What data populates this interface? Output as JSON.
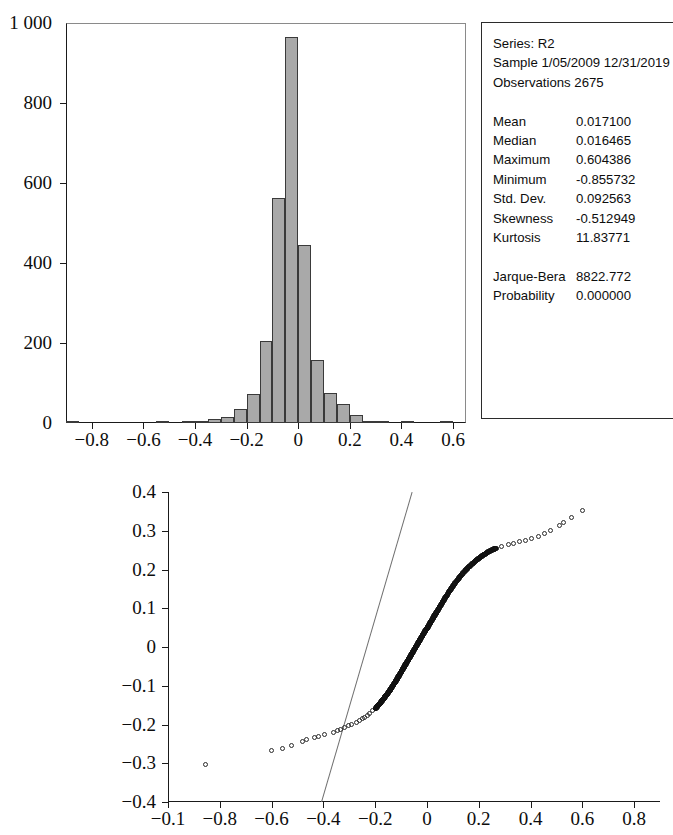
{
  "stats_box": {
    "header_lines": [
      "Series: R2",
      "Sample 1/05/2009 12/31/2019",
      "Observations 2675"
    ],
    "rows": [
      {
        "label": "Mean",
        "value": "0.017100"
      },
      {
        "label": "Median",
        "value": "0.016465"
      },
      {
        "label": "Maximum",
        "value": "0.604386"
      },
      {
        "label": "Minimum",
        "value": "-0.855732"
      },
      {
        "label": "Std. Dev.",
        "value": "0.092563"
      },
      {
        "label": "Skewness",
        "value": "-0.512949"
      },
      {
        "label": "Kurtosis",
        "value": "11.83771"
      }
    ],
    "test_rows": [
      {
        "label": "Jarque-Bera",
        "value": "8822.772"
      },
      {
        "label": "Probability",
        "value": "0.000000"
      }
    ]
  },
  "chart_data": [
    {
      "type": "bar",
      "name": "histogram",
      "title": "",
      "xlabel": "",
      "ylabel": "",
      "series_name": "R2",
      "observations": 2675,
      "bin_width": 0.05,
      "xlim": [
        -0.9,
        0.65
      ],
      "ylim": [
        0,
        1000
      ],
      "xticks": [
        -0.8,
        -0.6,
        -0.4,
        -0.2,
        0,
        0.2,
        0.4,
        0.6
      ],
      "xticklabels": [
        "−0.8",
        "−0.6",
        "−0.4",
        "−0.2",
        "0",
        "0.2",
        "0.4",
        "0.6"
      ],
      "yticks": [
        0,
        200,
        400,
        600,
        800,
        1000
      ],
      "yticklabels": [
        "0",
        "200",
        "400",
        "600",
        "800",
        "1 000"
      ],
      "grid": false,
      "bar_color": "#a9a9a9",
      "bar_edge_color": "#3a3a3a",
      "bins": [
        {
          "center": -0.875,
          "count": 3
        },
        {
          "center": -0.825,
          "count": 0
        },
        {
          "center": -0.775,
          "count": 0
        },
        {
          "center": -0.725,
          "count": 0
        },
        {
          "center": -0.675,
          "count": 0
        },
        {
          "center": -0.625,
          "count": 0
        },
        {
          "center": -0.575,
          "count": 0
        },
        {
          "center": -0.525,
          "count": 2
        },
        {
          "center": -0.475,
          "count": 0
        },
        {
          "center": -0.425,
          "count": 3
        },
        {
          "center": -0.375,
          "count": 4
        },
        {
          "center": -0.325,
          "count": 9
        },
        {
          "center": -0.275,
          "count": 16
        },
        {
          "center": -0.225,
          "count": 34
        },
        {
          "center": -0.175,
          "count": 72
        },
        {
          "center": -0.125,
          "count": 205
        },
        {
          "center": -0.075,
          "count": 562
        },
        {
          "center": -0.025,
          "count": 965
        },
        {
          "center": 0.025,
          "count": 444
        },
        {
          "center": 0.075,
          "count": 158
        },
        {
          "center": 0.125,
          "count": 74
        },
        {
          "center": 0.175,
          "count": 48
        },
        {
          "center": 0.225,
          "count": 20
        },
        {
          "center": 0.275,
          "count": 6
        },
        {
          "center": 0.325,
          "count": 3
        },
        {
          "center": 0.375,
          "count": 0
        },
        {
          "center": 0.425,
          "count": 2
        },
        {
          "center": 0.475,
          "count": 0
        },
        {
          "center": 0.525,
          "count": 0
        },
        {
          "center": 0.575,
          "count": 3
        }
      ]
    },
    {
      "type": "scatter",
      "name": "qq-plot",
      "title": "",
      "xlabel": "",
      "ylabel": "",
      "xlim": [
        -1.0,
        0.9
      ],
      "ylim": [
        -0.4,
        0.4
      ],
      "xticks": [
        -1.0,
        -0.8,
        -0.6,
        -0.4,
        -0.2,
        0,
        0.2,
        0.4,
        0.6,
        0.8
      ],
      "xticklabels": [
        "−0.1",
        "−0.8",
        "−0.6",
        "−0.4",
        "−0.2",
        "0",
        "0.2",
        "0.4",
        "0.6",
        "0.8"
      ],
      "yticks": [
        -0.4,
        -0.3,
        -0.2,
        -0.1,
        0,
        0.1,
        0.2,
        0.3,
        0.4
      ],
      "yticklabels": [
        "−0.4",
        "−0.3",
        "−0.2",
        "−0.1",
        "0",
        "0.1",
        "0.2",
        "0.3",
        "0.4"
      ],
      "grid": false,
      "marker": "open-circle",
      "marker_color": "#2a2a2a",
      "refline_color": "#6f6f6f",
      "refline": {
        "x0": -0.41,
        "y0": -0.4,
        "x1": -0.06,
        "y1": 0.4
      },
      "points": [
        {
          "x": -0.855,
          "y": -0.305
        },
        {
          "x": -0.6,
          "y": -0.268
        },
        {
          "x": -0.555,
          "y": -0.262
        },
        {
          "x": -0.52,
          "y": -0.255
        },
        {
          "x": -0.478,
          "y": -0.245
        },
        {
          "x": -0.462,
          "y": -0.241
        },
        {
          "x": -0.432,
          "y": -0.236
        },
        {
          "x": -0.418,
          "y": -0.233
        },
        {
          "x": -0.392,
          "y": -0.228
        },
        {
          "x": -0.36,
          "y": -0.221
        },
        {
          "x": -0.345,
          "y": -0.218
        },
        {
          "x": -0.33,
          "y": -0.213
        },
        {
          "x": -0.318,
          "y": -0.21
        },
        {
          "x": -0.3,
          "y": -0.205
        },
        {
          "x": -0.288,
          "y": -0.201
        },
        {
          "x": -0.272,
          "y": -0.196
        },
        {
          "x": -0.26,
          "y": -0.192
        },
        {
          "x": -0.248,
          "y": -0.187
        },
        {
          "x": -0.238,
          "y": -0.182
        },
        {
          "x": -0.228,
          "y": -0.177
        },
        {
          "x": -0.218,
          "y": -0.172
        },
        {
          "x": -0.208,
          "y": -0.166
        },
        {
          "x": -0.198,
          "y": -0.16
        },
        {
          "x": -0.19,
          "y": -0.154
        },
        {
          "x": -0.182,
          "y": -0.148
        },
        {
          "x": -0.174,
          "y": -0.141
        },
        {
          "x": -0.166,
          "y": -0.134
        },
        {
          "x": -0.158,
          "y": -0.127
        },
        {
          "x": -0.15,
          "y": -0.12
        },
        {
          "x": -0.142,
          "y": -0.113
        },
        {
          "x": -0.135,
          "y": -0.105
        },
        {
          "x": -0.128,
          "y": -0.098
        },
        {
          "x": -0.12,
          "y": -0.09
        },
        {
          "x": -0.113,
          "y": -0.082
        },
        {
          "x": -0.106,
          "y": -0.074
        },
        {
          "x": -0.099,
          "y": -0.066
        },
        {
          "x": -0.092,
          "y": -0.058
        },
        {
          "x": -0.085,
          "y": -0.05
        },
        {
          "x": -0.078,
          "y": -0.042
        },
        {
          "x": -0.071,
          "y": -0.034
        },
        {
          "x": -0.064,
          "y": -0.026
        },
        {
          "x": -0.057,
          "y": -0.018
        },
        {
          "x": -0.05,
          "y": -0.01
        },
        {
          "x": -0.043,
          "y": -0.002
        },
        {
          "x": -0.036,
          "y": 0.006
        },
        {
          "x": -0.029,
          "y": 0.014
        },
        {
          "x": -0.022,
          "y": 0.022
        },
        {
          "x": -0.015,
          "y": 0.03
        },
        {
          "x": -0.008,
          "y": 0.038
        },
        {
          "x": 0.0,
          "y": 0.046
        },
        {
          "x": 0.008,
          "y": 0.055
        },
        {
          "x": 0.016,
          "y": 0.064
        },
        {
          "x": 0.024,
          "y": 0.073
        },
        {
          "x": 0.033,
          "y": 0.083
        },
        {
          "x": 0.042,
          "y": 0.093
        },
        {
          "x": 0.052,
          "y": 0.104
        },
        {
          "x": 0.062,
          "y": 0.115
        },
        {
          "x": 0.073,
          "y": 0.127
        },
        {
          "x": 0.085,
          "y": 0.14
        },
        {
          "x": 0.098,
          "y": 0.153
        },
        {
          "x": 0.112,
          "y": 0.166
        },
        {
          "x": 0.127,
          "y": 0.179
        },
        {
          "x": 0.143,
          "y": 0.192
        },
        {
          "x": 0.16,
          "y": 0.204
        },
        {
          "x": 0.178,
          "y": 0.215
        },
        {
          "x": 0.196,
          "y": 0.225
        },
        {
          "x": 0.214,
          "y": 0.234
        },
        {
          "x": 0.232,
          "y": 0.242
        },
        {
          "x": 0.25,
          "y": 0.249
        },
        {
          "x": 0.268,
          "y": 0.254
        },
        {
          "x": 0.29,
          "y": 0.258
        },
        {
          "x": 0.316,
          "y": 0.262
        },
        {
          "x": 0.338,
          "y": 0.266
        },
        {
          "x": 0.36,
          "y": 0.27
        },
        {
          "x": 0.382,
          "y": 0.274
        },
        {
          "x": 0.404,
          "y": 0.278
        },
        {
          "x": 0.432,
          "y": 0.285
        },
        {
          "x": 0.455,
          "y": 0.292
        },
        {
          "x": 0.478,
          "y": 0.3
        },
        {
          "x": 0.512,
          "y": 0.312
        },
        {
          "x": 0.528,
          "y": 0.32
        },
        {
          "x": 0.56,
          "y": 0.332
        },
        {
          "x": 0.604,
          "y": 0.35
        }
      ],
      "dense_band": {
        "x_start": -0.205,
        "x_end": 0.272,
        "note": "overlapping markers form a solid dark band"
      }
    }
  ]
}
